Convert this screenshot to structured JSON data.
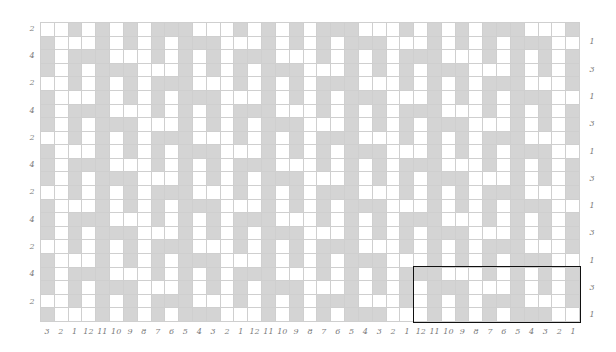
{
  "chart_title": "",
  "grid": {
    "columns": 39,
    "rows": 22,
    "cell_colors": {
      "filled": "#d4d4d4",
      "empty": "#ffffff",
      "gridline": "#cfcfcf",
      "outline": "#111111",
      "label": "#7a7a7a"
    },
    "repeat_unit": {
      "width": 12,
      "height": 4,
      "rows": [
        "..#.#.#.###.",
        "#...#.#.#.##",
        "#.###...#.#.",
        "#.#.###...#."
      ]
    }
  },
  "bottom_labels": [
    "3",
    "2",
    "1",
    "12",
    "11",
    "10",
    "9",
    "8",
    "7",
    "6",
    "5",
    "4",
    "3",
    "2",
    "1",
    "12",
    "11",
    "10",
    "9",
    "8",
    "7",
    "6",
    "5",
    "4",
    "3",
    "2",
    "1",
    "12",
    "11",
    "10",
    "9",
    "8",
    "7",
    "6",
    "5",
    "4",
    "3",
    "2",
    "1"
  ],
  "left_labels": [
    {
      "row": 0,
      "text": "2"
    },
    {
      "row": 2,
      "text": "4"
    },
    {
      "row": 4,
      "text": "2"
    },
    {
      "row": 6,
      "text": "4"
    },
    {
      "row": 8,
      "text": "2"
    },
    {
      "row": 10,
      "text": "4"
    },
    {
      "row": 12,
      "text": "2"
    },
    {
      "row": 14,
      "text": "4"
    },
    {
      "row": 16,
      "text": "2"
    },
    {
      "row": 18,
      "text": "4"
    },
    {
      "row": 20,
      "text": "2"
    }
  ],
  "right_labels": [
    {
      "row": 1,
      "text": "1"
    },
    {
      "row": 3,
      "text": "3"
    },
    {
      "row": 5,
      "text": "1"
    },
    {
      "row": 7,
      "text": "3"
    },
    {
      "row": 9,
      "text": "1"
    },
    {
      "row": 11,
      "text": "3"
    },
    {
      "row": 13,
      "text": "1"
    },
    {
      "row": 15,
      "text": "3"
    },
    {
      "row": 17,
      "text": "1"
    },
    {
      "row": 19,
      "text": "3"
    },
    {
      "row": 21,
      "text": "1"
    }
  ],
  "repeat_outline": {
    "col_start": 27,
    "col_end": 38,
    "row_start": 18,
    "row_end": 21
  }
}
